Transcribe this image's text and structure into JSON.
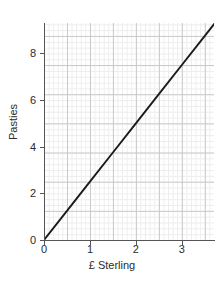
{
  "chart_data": {
    "type": "line",
    "title": "",
    "subtitle": "",
    "xlabel": "£ Sterling",
    "ylabel": "Pasties",
    "xlim": [
      0,
      3.7
    ],
    "ylim": [
      0,
      9.3
    ],
    "xticks": [
      0,
      1,
      2,
      3
    ],
    "xtick_labels": [
      "0",
      "1",
      "2",
      "3"
    ],
    "yticks": [
      0,
      2,
      4,
      6,
      8
    ],
    "ytick_labels": [
      "0",
      "2",
      "4",
      "6",
      "8"
    ],
    "grid": true,
    "grid_minor": true,
    "grid_minor_step_x": 0.1,
    "grid_minor_step_y": 0.25,
    "grid_major_step_x": 0.5,
    "grid_major_step_y": 1.25,
    "legend": "none",
    "series": [
      {
        "name": "Pasties per £ Sterling",
        "slope": 2.5,
        "intercept": 0,
        "color": "#1a1a1a",
        "x": [
          0,
          0.5,
          1,
          1.5,
          2,
          2.5,
          3,
          3.5,
          3.7
        ],
        "y": [
          0,
          1.25,
          2.5,
          3.75,
          5,
          6.25,
          7.5,
          8.75,
          9.25
        ]
      }
    ],
    "annotations": []
  },
  "colors": {
    "line": "#1a1a1a",
    "grid_minor": "#ededed",
    "grid_major": "#c9c9c9",
    "axis": "#555555",
    "text": "#2b2b2b",
    "background": "#ffffff"
  }
}
